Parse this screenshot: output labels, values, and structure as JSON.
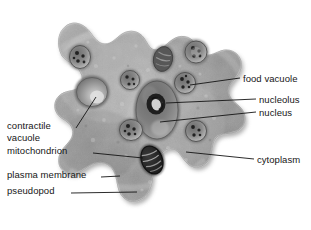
{
  "figure": {
    "background_color": "#ffffff",
    "body_fill": "#9a9a9a",
    "body_outline": "#4a4a4a",
    "leader_line_color": "#1a1a1a",
    "text_color": "#161616"
  },
  "labels": {
    "food_vacuole": "food vacuole",
    "nucleolus": "nucleolus",
    "nucleus": "nucleus",
    "cytoplasm": "cytoplasm",
    "contractile_line1": "contractile",
    "contractile_line2": "vacuole",
    "mitochondrion": "mitochondrion",
    "plasma_membrane": "plasma membrane",
    "pseudopod": "pseudopod"
  },
  "callouts": [
    {
      "name": "food-vacuole",
      "side": "right",
      "text": "food vacuole",
      "text_x": 243,
      "text_y": 78
    },
    {
      "name": "nucleolus",
      "side": "right",
      "text": "nucleolus",
      "text_x": 259,
      "text_y": 99
    },
    {
      "name": "nucleus",
      "side": "right",
      "text": "nucleus",
      "text_x": 259,
      "text_y": 112
    },
    {
      "name": "cytoplasm",
      "side": "right",
      "text": "cytoplasm",
      "text_x": 257,
      "text_y": 159
    },
    {
      "name": "contractile-vacuole",
      "side": "left",
      "text": "contractile vacuole",
      "text_x": 7,
      "text_y": 125
    },
    {
      "name": "mitochondrion",
      "side": "left",
      "text": "mitochondrion",
      "text_x": 7,
      "text_y": 150
    },
    {
      "name": "plasma-membrane",
      "side": "left",
      "text": "plasma membrane",
      "text_x": 7,
      "text_y": 174
    },
    {
      "name": "pseudopod",
      "side": "left",
      "text": "pseudopod",
      "text_x": 7,
      "text_y": 190
    }
  ],
  "organelles": [
    {
      "name": "nucleus",
      "type": "nucleus",
      "cx": 157,
      "cy": 110,
      "rx": 22,
      "ry": 30
    },
    {
      "name": "nucleolus",
      "type": "nucleolus",
      "cx": 156,
      "cy": 104,
      "rx": 9,
      "ry": 10
    },
    {
      "name": "contractile-vacuole",
      "type": "contractile-vacuole",
      "cx": 92,
      "cy": 92,
      "rx": 17,
      "ry": 16
    },
    {
      "name": "mitochondrion",
      "type": "mitochondrion",
      "cx": 152,
      "cy": 160,
      "rx": 11,
      "ry": 15
    },
    {
      "name": "food-vacuole-1",
      "type": "food-vacuole",
      "cx": 80,
      "cy": 57,
      "rx": 11,
      "ry": 12
    },
    {
      "name": "food-vacuole-2",
      "type": "food-vacuole",
      "cx": 130,
      "cy": 80,
      "rx": 10,
      "ry": 10
    },
    {
      "name": "food-vacuole-3",
      "type": "food-vacuole",
      "cx": 163,
      "cy": 59,
      "rx": 10,
      "ry": 13
    },
    {
      "name": "food-vacuole-4",
      "type": "food-vacuole",
      "cx": 196,
      "cy": 52,
      "rx": 12,
      "ry": 12
    },
    {
      "name": "food-vacuole-5",
      "type": "food-vacuole",
      "cx": 185,
      "cy": 83,
      "rx": 11,
      "ry": 11
    },
    {
      "name": "food-vacuole-6",
      "type": "food-vacuole",
      "cx": 131,
      "cy": 130,
      "rx": 12,
      "ry": 12
    },
    {
      "name": "food-vacuole-7",
      "type": "food-vacuole",
      "cx": 196,
      "cy": 131,
      "rx": 11,
      "ry": 11
    }
  ]
}
